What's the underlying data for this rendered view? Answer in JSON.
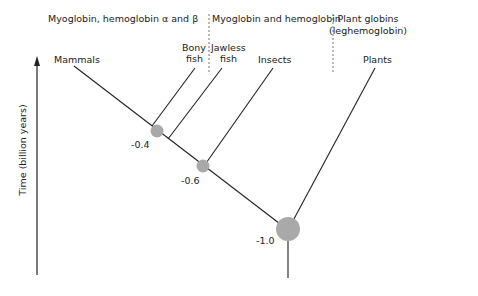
{
  "diagram": {
    "type": "phylogenetic-tree",
    "headers": [
      {
        "id": "left",
        "label": "Myoglobin, hemoglobin α and β"
      },
      {
        "id": "middle",
        "label": "Myoglobin and hemoglobin"
      },
      {
        "id": "right_line1",
        "label": "Plant globins"
      },
      {
        "id": "right_line2",
        "label": "(leghemoglobin)"
      }
    ],
    "taxa": [
      {
        "id": "mammals",
        "label": "Mammals"
      },
      {
        "id": "bony_fish_1",
        "label": "Bony"
      },
      {
        "id": "bony_fish_2",
        "label": "fish"
      },
      {
        "id": "jawless_fish_1",
        "label": "Jawless"
      },
      {
        "id": "jawless_fish_2",
        "label": "fish"
      },
      {
        "id": "insects",
        "label": "Insects"
      },
      {
        "id": "plants",
        "label": "Plants"
      }
    ],
    "nodes": [
      {
        "id": "node-0.4",
        "label": "-0.4",
        "time_billion_years": -0.4
      },
      {
        "id": "node-0.6",
        "label": "-0.6",
        "time_billion_years": -0.6
      },
      {
        "id": "node-1.0",
        "label": "-1.0",
        "time_billion_years": -1.0
      }
    ],
    "axis": {
      "label": "Time (billion years)",
      "direction": "up"
    },
    "colors": {
      "line": "#222222",
      "node": "#a9a9a9",
      "divider": "#777777"
    }
  }
}
